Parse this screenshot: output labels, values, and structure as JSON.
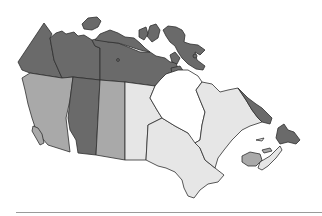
{
  "map": {
    "subject": "Canada",
    "type": "choropleth-grayscale",
    "colors": {
      "dark": "#6a6a6a",
      "medium": "#a9a9a9",
      "light": "#e6e6e6",
      "white": "#ffffff",
      "outline": "#2e2e2e",
      "baseline": "#9a9a9a"
    },
    "regions": [
      {
        "id": "yukon",
        "shade": "dark"
      },
      {
        "id": "northwest-territories",
        "shade": "dark"
      },
      {
        "id": "nunavut",
        "shade": "dark"
      },
      {
        "id": "arctic-islands",
        "shade": "dark"
      },
      {
        "id": "british-columbia",
        "shade": "medium"
      },
      {
        "id": "alberta",
        "shade": "dark"
      },
      {
        "id": "saskatchewan",
        "shade": "medium"
      },
      {
        "id": "manitoba",
        "shade": "light"
      },
      {
        "id": "hudson-bay",
        "shade": "white"
      },
      {
        "id": "ontario",
        "shade": "light"
      },
      {
        "id": "quebec",
        "shade": "light"
      },
      {
        "id": "labrador",
        "shade": "dark"
      },
      {
        "id": "newfoundland",
        "shade": "dark"
      },
      {
        "id": "nova-scotia",
        "shade": "light"
      },
      {
        "id": "new-brunswick",
        "shade": "medium"
      },
      {
        "id": "prince-edward-island",
        "shade": "medium"
      }
    ]
  }
}
